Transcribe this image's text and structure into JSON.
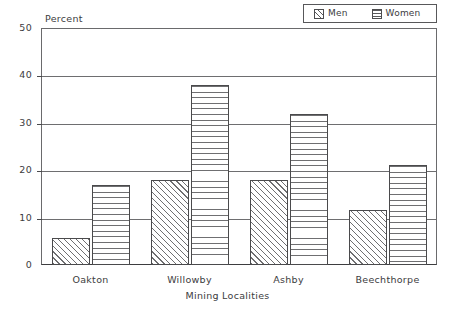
{
  "chart_data": {
    "type": "bar",
    "title": "",
    "categories": [
      "Oakton",
      "Willowby",
      "Ashby",
      "Beechthorpe"
    ],
    "series": [
      {
        "name": "Men",
        "values": [
          5.8,
          17.9,
          17.9,
          11.7
        ],
        "pattern": "diagonal-hatch"
      },
      {
        "name": "Women",
        "values": [
          16.9,
          37.9,
          31.8,
          21.0
        ],
        "pattern": "horizontal-lines"
      }
    ],
    "xlabel": "Mining Localities",
    "ylabel": "Percent",
    "ylim": [
      0,
      50
    ],
    "yticks": [
      0,
      10,
      20,
      30,
      40,
      50
    ],
    "ytick_labels": [
      "0",
      "10",
      "20",
      "30",
      "40",
      "50"
    ],
    "grid": "horizontal",
    "legend_position": "top-right",
    "colors": {
      "axis": "#4a4a4c",
      "grid": "#6e6e70",
      "text": "#3c3c3e",
      "hatch": "#6f6f71",
      "background": "#ffffff"
    }
  },
  "legend": {
    "entries": [
      {
        "label": "Men",
        "swatch": "diagonal-hatch-swatch"
      },
      {
        "label": "Women",
        "swatch": "horizontal-lines-swatch"
      }
    ]
  },
  "axes": {
    "y_axis_title": "Percent",
    "x_axis_title": "Mining Localities"
  }
}
